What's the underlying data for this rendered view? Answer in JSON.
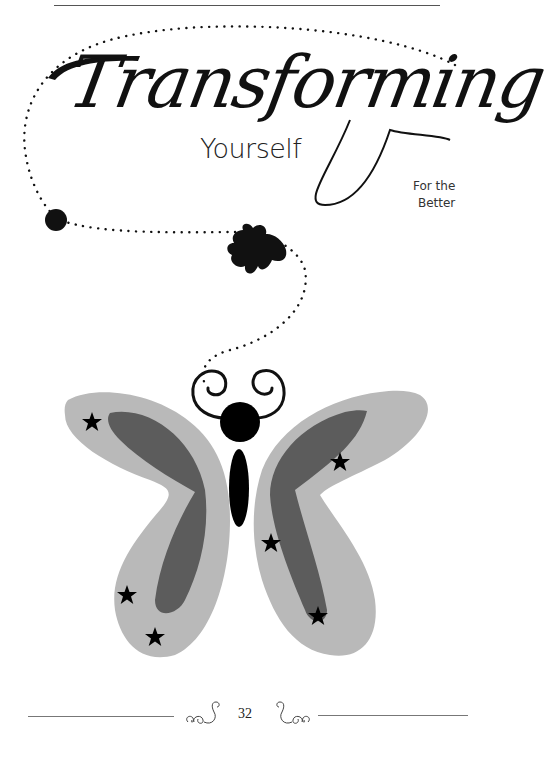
{
  "page": {
    "title_script": "Transforming",
    "title_main": "Yourself",
    "subtitle_line1": "For the",
    "subtitle_line2": "Better",
    "page_number": "32"
  },
  "illustration": {
    "subject": "butterfly",
    "wing_outer_color": "#b9b9b9",
    "wing_inner_color": "#5c5c5c",
    "body_color": "#000000",
    "star_count": 6,
    "path_style": "dotted"
  }
}
